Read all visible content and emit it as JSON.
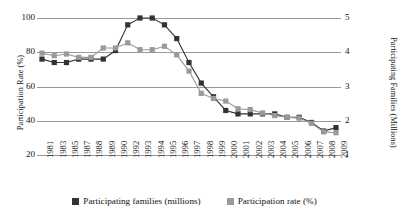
{
  "chart_data": {
    "type": "line",
    "title": "",
    "grid": true,
    "legend_position": "bottom",
    "categories": [
      "1981",
      "1983",
      "1985",
      "1987",
      "1988",
      "1989",
      "1990",
      "1992",
      "1993",
      "1994",
      "1995",
      "1996",
      "1997",
      "1998",
      "1999",
      "2000",
      "2001",
      "2002",
      "2003",
      "2004",
      "2005",
      "2006",
      "2007",
      "2008",
      "2009"
    ],
    "axes": {
      "left": {
        "label": "Participation Rate (%)",
        "ticks": [
          "20",
          "40",
          "60",
          "80",
          "100"
        ],
        "tick_values": [
          20,
          40,
          60,
          80,
          100
        ],
        "ylim": [
          20,
          100
        ]
      },
      "right": {
        "label": "Participating Families (Millions)",
        "ticks": [
          "1",
          "2",
          "3",
          "4",
          "5"
        ],
        "tick_values": [
          1,
          2,
          3,
          4,
          5
        ],
        "ylim": [
          1,
          5
        ]
      },
      "x": {
        "label": ""
      }
    },
    "series": [
      {
        "name": "Participating families (millions)",
        "color": "#333333",
        "axis": "right",
        "marker": "square",
        "values": [
          3.8,
          3.7,
          3.7,
          3.8,
          3.8,
          3.8,
          4.05,
          4.8,
          5.0,
          5.0,
          4.8,
          4.4,
          3.7,
          3.1,
          2.7,
          2.3,
          2.2,
          2.2,
          2.2,
          2.2,
          2.1,
          2.1,
          1.95,
          1.7,
          1.8
        ]
      },
      {
        "name": "Participation rate (%)",
        "color": "#9a9a9a",
        "axis": "left",
        "marker": "square",
        "values": [
          79.5,
          78,
          79,
          77,
          77,
          82.5,
          82.5,
          85.5,
          81.5,
          81.5,
          83.5,
          78.5,
          69,
          56,
          53,
          51.5,
          47,
          46.5,
          44.5,
          43,
          42,
          41.5,
          38.5,
          33.5,
          33
        ]
      }
    ],
    "annotations": []
  },
  "legend": {
    "items": [
      {
        "label": "Participating families (millions)",
        "color": "#333333"
      },
      {
        "label": "Participation rate (%)",
        "color": "#9a9a9a"
      }
    ]
  }
}
